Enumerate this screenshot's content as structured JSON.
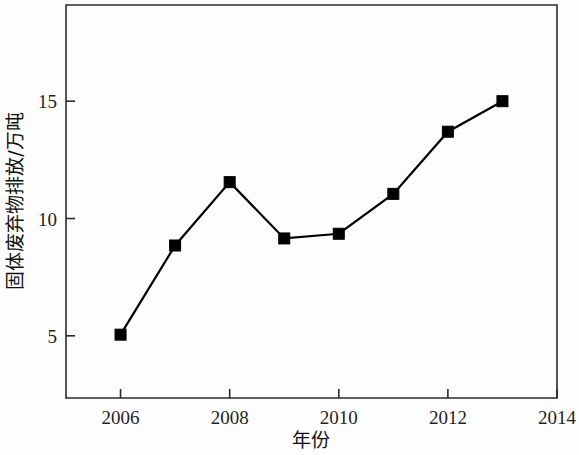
{
  "chart_data": {
    "type": "line",
    "title": "",
    "subtitle": "",
    "xlabel": "年份",
    "ylabel": "固体废弃物排放/万吨",
    "x": [
      2006,
      2007,
      2008,
      2009,
      2010,
      2011,
      2012,
      2013
    ],
    "values": [
      5.05,
      8.85,
      11.55,
      9.15,
      9.35,
      11.05,
      13.7,
      15.0
    ],
    "series": [
      {
        "name": "固体废弃物排放",
        "values": [
          5.05,
          8.85,
          11.55,
          9.15,
          9.35,
          11.05,
          13.7,
          15.0
        ]
      }
    ],
    "xlim": [
      2005,
      2014
    ],
    "ylim": [
      2.35,
      19.1
    ],
    "x_tick_values": [
      2006,
      2008,
      2010,
      2012,
      2014
    ],
    "x_tick_labels": [
      "2006",
      "2008",
      "2010",
      "2012",
      "2014"
    ],
    "y_tick_values": [
      5,
      10,
      15
    ],
    "y_tick_labels": [
      "5",
      "10",
      "15"
    ],
    "grid": false,
    "legend": "none",
    "marker": "square",
    "marker_color": "#000000",
    "line_color": "#000000",
    "axis_color": "#2b2b2b",
    "background_color": "#fdfdfd"
  },
  "axes": {
    "x_ticks": [
      {
        "value": 2006,
        "label": "2006"
      },
      {
        "value": 2008,
        "label": "2008"
      },
      {
        "value": 2010,
        "label": "2010"
      },
      {
        "value": 2012,
        "label": "2012"
      },
      {
        "value": 2014,
        "label": "2014"
      }
    ],
    "y_ticks": [
      {
        "value": 15,
        "label": "15"
      },
      {
        "value": 10,
        "label": "10"
      },
      {
        "value": 5,
        "label": "5"
      }
    ],
    "x_axis_title": "年份",
    "y_axis_title": "固体废弃物排放/万吨"
  }
}
